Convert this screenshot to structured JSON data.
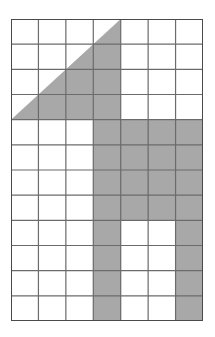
{
  "figure": {
    "grid": {
      "columns": 7,
      "rows": 12,
      "cell_width": 27.43,
      "cell_height": 25.17,
      "origin_x": 11,
      "origin_y": 19,
      "width": 192,
      "height": 302
    },
    "colors": {
      "shade": "#a8a8a8",
      "gridline": "#6b6b6b",
      "border": "#4a4a4a",
      "background": "#ffffff",
      "page": "#ffffff"
    },
    "triangle": {
      "name": "upper-left-right-triangle",
      "vertices_cells": [
        [
          0,
          4
        ],
        [
          4,
          4
        ],
        [
          4,
          0
        ]
      ],
      "comment": "Right triangle with legs of 4 cells; right angle at grid column 4 row 4 (top-right corner of the leg block), hypotenuse runs from column 0 row 4 up to column 4 row 0"
    },
    "shaded_cells": [
      [
        4,
        3
      ],
      [
        4,
        4
      ],
      [
        4,
        5
      ],
      [
        4,
        6
      ],
      [
        5,
        3
      ],
      [
        5,
        4
      ],
      [
        5,
        5
      ],
      [
        5,
        6
      ],
      [
        6,
        3
      ],
      [
        6,
        4
      ],
      [
        6,
        5
      ],
      [
        6,
        6
      ],
      [
        7,
        3
      ],
      [
        7,
        4
      ],
      [
        7,
        5
      ],
      [
        7,
        6
      ],
      [
        8,
        3
      ],
      [
        8,
        6
      ],
      [
        9,
        3
      ],
      [
        9,
        6
      ],
      [
        10,
        3
      ],
      [
        10,
        6
      ],
      [
        11,
        3
      ],
      [
        11,
        6
      ]
    ],
    "shaded_cell_count": 24,
    "labels": {
      "none": ""
    }
  }
}
